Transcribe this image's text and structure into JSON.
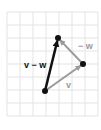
{
  "diagram": {
    "type": "vector-diagram",
    "grid": {
      "x0": 7,
      "y0": 12,
      "cell": 13,
      "cols": 7,
      "rows": 8,
      "color": "#e3e3e3"
    },
    "points": {
      "origin": {
        "x": 45,
        "y": 91
      },
      "v_tip": {
        "x": 83,
        "y": 64
      },
      "top": {
        "x": 58,
        "y": 38
      }
    },
    "vectors": [
      {
        "name": "v",
        "from": "origin",
        "to": "v_tip",
        "color": "#9a9a9a",
        "width": 2
      },
      {
        "name": "-w",
        "from": "v_tip",
        "to": "top",
        "color": "#9a9a9a",
        "width": 2
      },
      {
        "name": "v - w",
        "from": "origin",
        "to": "top",
        "color": "#111111",
        "width": 2.5
      }
    ],
    "labels": {
      "v_minus_w": "v − w",
      "neg_w": "− w",
      "v": "v"
    },
    "colors": {
      "dark": "#111111",
      "gray": "#9a9a9a"
    }
  }
}
